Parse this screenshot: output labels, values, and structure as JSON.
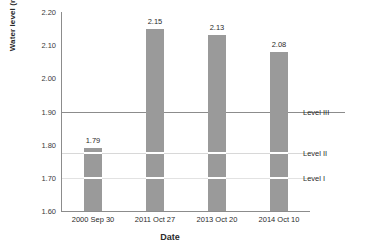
{
  "chart_data": {
    "type": "bar",
    "title": "",
    "xlabel": "Date",
    "ylabel": "Water level (m above msl)",
    "categories": [
      "2000 Sep 30",
      "2011 Oct 27",
      "2013 Oct 20",
      "2014 Oct 10"
    ],
    "values": [
      1.79,
      2.15,
      2.13,
      2.08
    ],
    "data_labels": [
      "1.79",
      "2.15",
      "2.13",
      "2.08"
    ],
    "ylim": [
      1.6,
      2.2
    ],
    "yticks": [
      2.2,
      2.1,
      2.0,
      1.9,
      1.8,
      1.7,
      1.6
    ],
    "ytick_labels": [
      "2.20",
      "2.10",
      "2.00",
      "1.90",
      "1.80",
      "1.70",
      "1.60"
    ],
    "grid": false,
    "legend": "none",
    "bar_color": "#9a9a9a",
    "axis_color": "#8c8c8c",
    "reference_lines": [
      {
        "label": "Level III",
        "value": 1.9,
        "color": "#8c8c8c",
        "style": "solid"
      },
      {
        "label": "Level II",
        "value": 1.775,
        "color": "#d8d8d8",
        "style": "solid"
      },
      {
        "label": "Level I",
        "value": 1.7,
        "color": "#e2e2e2",
        "style": "solid"
      }
    ]
  }
}
